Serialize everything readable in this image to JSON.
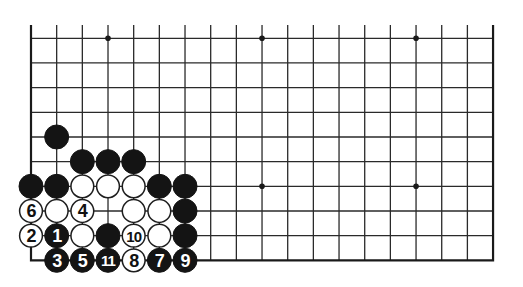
{
  "diagram": {
    "type": "go-board-diagram",
    "board": {
      "columns": 19,
      "visible_rows": 10,
      "edges_shown": [
        "left",
        "right",
        "bottom"
      ],
      "top_edge_shown": false
    },
    "colors": {
      "line": "#2a2a2a",
      "black_stone": "#141414",
      "white_stone": "#ffffff",
      "background": "#ffffff"
    },
    "hoshi": [
      {
        "col": 3,
        "row": 0
      },
      {
        "col": 9,
        "row": 0
      },
      {
        "col": 15,
        "row": 0
      },
      {
        "col": 9,
        "row": 6
      },
      {
        "col": 15,
        "row": 6
      }
    ],
    "stones": [
      {
        "col": 1,
        "row": 4,
        "color": "black",
        "label": ""
      },
      {
        "col": 2,
        "row": 5,
        "color": "black",
        "label": ""
      },
      {
        "col": 3,
        "row": 5,
        "color": "black",
        "label": ""
      },
      {
        "col": 4,
        "row": 5,
        "color": "black",
        "label": ""
      },
      {
        "col": 0,
        "row": 6,
        "color": "black",
        "label": ""
      },
      {
        "col": 1,
        "row": 6,
        "color": "black",
        "label": ""
      },
      {
        "col": 2,
        "row": 6,
        "color": "white",
        "label": ""
      },
      {
        "col": 3,
        "row": 6,
        "color": "white",
        "label": ""
      },
      {
        "col": 4,
        "row": 6,
        "color": "white",
        "label": ""
      },
      {
        "col": 5,
        "row": 6,
        "color": "black",
        "label": ""
      },
      {
        "col": 6,
        "row": 6,
        "color": "black",
        "label": ""
      },
      {
        "col": 0,
        "row": 7,
        "color": "white",
        "label": "6"
      },
      {
        "col": 1,
        "row": 7,
        "color": "white",
        "label": ""
      },
      {
        "col": 2,
        "row": 7,
        "color": "white",
        "label": "4"
      },
      {
        "col": 4,
        "row": 7,
        "color": "white",
        "label": ""
      },
      {
        "col": 5,
        "row": 7,
        "color": "white",
        "label": ""
      },
      {
        "col": 6,
        "row": 7,
        "color": "black",
        "label": ""
      },
      {
        "col": 0,
        "row": 8,
        "color": "white",
        "label": "2"
      },
      {
        "col": 1,
        "row": 8,
        "color": "black",
        "label": "1"
      },
      {
        "col": 2,
        "row": 8,
        "color": "white",
        "label": ""
      },
      {
        "col": 3,
        "row": 8,
        "color": "black",
        "label": ""
      },
      {
        "col": 4,
        "row": 8,
        "color": "white",
        "label": "10"
      },
      {
        "col": 5,
        "row": 8,
        "color": "white",
        "label": ""
      },
      {
        "col": 6,
        "row": 8,
        "color": "black",
        "label": ""
      },
      {
        "col": 1,
        "row": 9,
        "color": "black",
        "label": "3"
      },
      {
        "col": 2,
        "row": 9,
        "color": "black",
        "label": "5"
      },
      {
        "col": 3,
        "row": 9,
        "color": "black",
        "label": "11"
      },
      {
        "col": 4,
        "row": 9,
        "color": "white",
        "label": "8"
      },
      {
        "col": 5,
        "row": 9,
        "color": "black",
        "label": "7"
      },
      {
        "col": 6,
        "row": 9,
        "color": "black",
        "label": "9"
      }
    ]
  }
}
